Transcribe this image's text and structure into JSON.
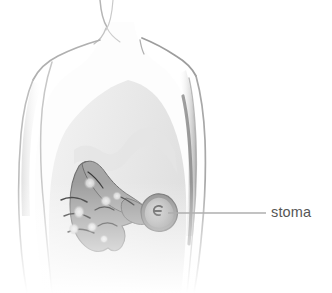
{
  "figure": {
    "type": "medical-illustration",
    "background_color": "#ffffff"
  },
  "labels": [
    {
      "id": "stoma",
      "text": "stoma",
      "color": "#565656",
      "x": 271,
      "y": 203
    }
  ],
  "leader_line": {
    "color": "#8f8f8f",
    "from_x": 168,
    "from_y": 213,
    "to_x": 266,
    "to_y": 213
  },
  "palette": {
    "body_outline": "#b9b9b9",
    "body_shadow": "#8d8d8d",
    "body_fill": "#ffffff",
    "abdomen_shade": "#e6e6e6",
    "torso_shade": "#ededed",
    "bowel_fill": "#9d9d9d",
    "bowel_edge": "#6f6f6f",
    "bowel_highlight": "#dcdcdc",
    "haustra_line": "#3a3a3a",
    "stoma_rim": "#8e8e8e",
    "stoma_face": "#b5b5b5",
    "stoma_center": "#555555",
    "label_text": "#565656",
    "leader_line": "#8f8f8f"
  },
  "anatomy_parts": [
    {
      "id": "neck",
      "name": "neck"
    },
    {
      "id": "left-shoulder",
      "name": "left-shoulder"
    },
    {
      "id": "right-shoulder",
      "name": "right-shoulder"
    },
    {
      "id": "left-arm",
      "name": "left-arm"
    },
    {
      "id": "right-arm",
      "name": "right-arm"
    },
    {
      "id": "torso",
      "name": "torso"
    },
    {
      "id": "abdomen-shading",
      "name": "abdomen-shading"
    },
    {
      "id": "colon",
      "name": "colon"
    },
    {
      "id": "stoma",
      "name": "stoma"
    }
  ]
}
